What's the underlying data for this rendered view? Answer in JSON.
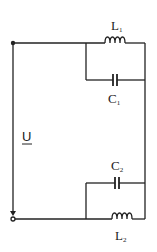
{
  "diagram": {
    "type": "circuit",
    "voltage_label": "U",
    "components": [
      {
        "id": "L1",
        "kind": "inductor",
        "letter": "L",
        "subscript": "1"
      },
      {
        "id": "C1",
        "kind": "capacitor",
        "letter": "C",
        "subscript": "1"
      },
      {
        "id": "C2",
        "kind": "capacitor",
        "letter": "C",
        "subscript": "2"
      },
      {
        "id": "L2",
        "kind": "inductor",
        "letter": "L",
        "subscript": "2"
      }
    ],
    "topology": "U source across series connection of (L1 || C1) and (C2 || L2)",
    "colors": {
      "wire": "#222222",
      "background": "#ffffff"
    }
  }
}
